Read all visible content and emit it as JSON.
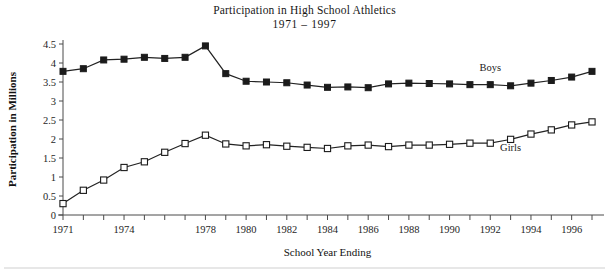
{
  "chart_data": {
    "type": "line",
    "title": "Participation in High School Athletics",
    "subtitle": "1971 – 1997",
    "xlabel": "School Year Ending",
    "ylabel": "Participation in Millions",
    "xlim": [
      1971,
      1997
    ],
    "ylim": [
      0,
      4.5
    ],
    "ytick_step": 0.5,
    "grid": false,
    "legend": "inline-labels",
    "x": [
      1971,
      1972,
      1973,
      1974,
      1975,
      1976,
      1977,
      1978,
      1979,
      1980,
      1981,
      1982,
      1983,
      1984,
      1985,
      1986,
      1987,
      1988,
      1989,
      1990,
      1991,
      1992,
      1993,
      1994,
      1995,
      1996,
      1997
    ],
    "xtick_labels": [
      "1971",
      "1974",
      "1978",
      "1980",
      "1982",
      "1984",
      "1986",
      "1988",
      "1990",
      "1992",
      "1994",
      "1996"
    ],
    "xtick_values": [
      1971,
      1974,
      1978,
      1980,
      1982,
      1984,
      1986,
      1988,
      1990,
      1992,
      1994,
      1996
    ],
    "ytick_labels": [
      "0",
      "0.5",
      "1",
      "1.5",
      "2",
      "2.5",
      "3",
      "3.5",
      "4",
      "4.5"
    ],
    "ytick_values": [
      0,
      0.5,
      1,
      1.5,
      2,
      2.5,
      3,
      3.5,
      4,
      4.5
    ],
    "series": [
      {
        "name": "Boys",
        "marker": "filled-square",
        "label_x": 1992,
        "label_y": 3.78,
        "values": [
          3.78,
          3.85,
          4.08,
          4.1,
          4.15,
          4.12,
          4.15,
          4.45,
          3.72,
          3.52,
          3.5,
          3.48,
          3.42,
          3.36,
          3.37,
          3.35,
          3.45,
          3.47,
          3.46,
          3.45,
          3.43,
          3.43,
          3.4,
          3.47,
          3.54,
          3.63,
          3.78
        ]
      },
      {
        "name": "Girls",
        "marker": "open-square",
        "label_x": 1993,
        "label_y": 1.68,
        "values": [
          0.3,
          0.65,
          0.92,
          1.25,
          1.4,
          1.65,
          1.88,
          2.1,
          1.87,
          1.82,
          1.85,
          1.81,
          1.78,
          1.75,
          1.82,
          1.84,
          1.8,
          1.84,
          1.84,
          1.86,
          1.89,
          1.89,
          1.99,
          2.13,
          2.24,
          2.37,
          2.45
        ]
      }
    ]
  },
  "figure": {
    "bottom_rule": true
  }
}
